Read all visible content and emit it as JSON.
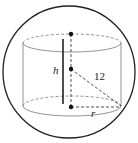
{
  "diagram": {
    "labels": {
      "height": "h",
      "radius": "r",
      "sphere_radius": "12"
    },
    "colors": {
      "stroke": "#222222",
      "light_stroke": "#777777",
      "background": "#ffffff"
    }
  }
}
